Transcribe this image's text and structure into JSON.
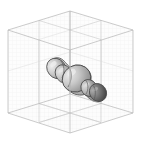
{
  "figure": {
    "title": "",
    "type": "3d-volume-render",
    "background_color": "#ffffff",
    "width": 142,
    "height": 161
  },
  "bounding_box": {
    "name": "isometric-wireframe-box",
    "edge_color": "#b4b4b4",
    "edge_width": 0.7,
    "grid_color": "#e4e4e4",
    "grid_width": 0.35,
    "grid_divisions": 16,
    "face_fill": "#fdfdfd",
    "vertices": {
      "top": [
        70,
        11
      ],
      "left_upper": [
        8,
        30
      ],
      "right_upper": [
        133,
        30
      ],
      "center": [
        70,
        94
      ],
      "left_lower": [
        8,
        113
      ],
      "right_lower": [
        133,
        113
      ],
      "bottom": [
        70,
        133
      ]
    }
  },
  "internal_planes": {
    "name": "midplane-dividers",
    "line_color": "#bfbfbf",
    "count": 3,
    "labels": [
      "vertical-plane-left",
      "vertical-plane-right",
      "floor-plane"
    ]
  },
  "object": {
    "name": "lobed-blob-chain",
    "description": "chain of shaded ellipsoidal lobes oriented diagonally",
    "outline_color": "#4a4a4a",
    "outline_width": 0.8,
    "lobes": [
      {
        "id": "lobe-1",
        "cx": 56.5,
        "cy": 68.5,
        "rx": 9.5,
        "ry": 11.0,
        "rot": -38,
        "fill_light": "#d8d8d8",
        "fill_dark": "#8e8e8e"
      },
      {
        "id": "lobe-2",
        "cx": 64.0,
        "cy": 74.0,
        "rx": 8.5,
        "ry": 10.0,
        "rot": -38,
        "fill_light": "#cfcfcf",
        "fill_dark": "#8a8a8a"
      },
      {
        "id": "lobe-3",
        "cx": 76.5,
        "cy": 78.5,
        "rx": 15.0,
        "ry": 13.5,
        "rot": -30,
        "fill_light": "#d5d5d5",
        "fill_dark": "#8d8d8d"
      },
      {
        "id": "lobe-4",
        "cx": 89.0,
        "cy": 88.0,
        "rx": 8.0,
        "ry": 9.0,
        "rot": -35,
        "fill_light": "#c8c8c8",
        "fill_dark": "#7e7e7e"
      },
      {
        "id": "lobe-5",
        "cx": 98.0,
        "cy": 92.5,
        "rx": 8.5,
        "ry": 9.5,
        "rot": -35,
        "fill_light": "#9a9a9a",
        "fill_dark": "#4f4f4f"
      }
    ],
    "palette": {
      "highlight": "#e2e2e2",
      "midtone": "#b0b0b0",
      "shadow": "#5a5a5a",
      "darkest": "#3c3c3c"
    }
  },
  "annotations": {
    "axis_labels": [],
    "tick_labels": [],
    "legend_entries": [],
    "caption": ""
  }
}
